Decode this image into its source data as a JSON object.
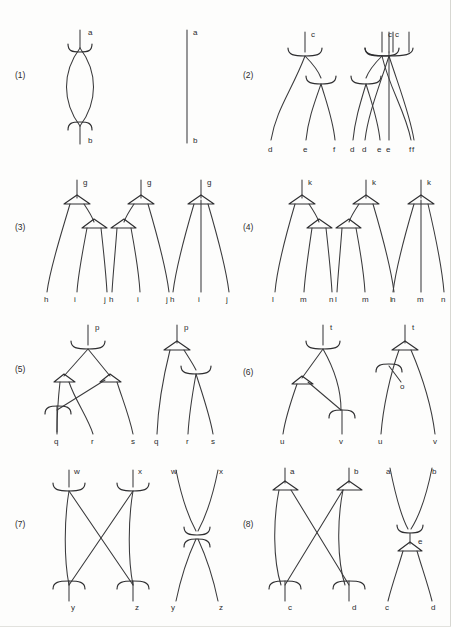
{
  "figure": {
    "background_color": "#fdfdfc",
    "stroke_color": "#3a3a3c",
    "node_types": [
      "bracket-cup-down",
      "bracket-cup-up",
      "hollow-triangle"
    ],
    "row_labels": [
      "(1)",
      "(2)",
      "(3)",
      "(4)",
      "(5)",
      "(6)",
      "(7)",
      "(8)"
    ],
    "rows": [
      {
        "number": "(1)",
        "panels": [
          {
            "id": "1a",
            "root_labels": [
              "a"
            ],
            "leaf_labels": [
              "b"
            ],
            "node_marks": [
              "bracket-cup-down",
              "bracket-cup-up"
            ],
            "shape": "lens"
          },
          {
            "id": "1b",
            "root_labels": [
              "a"
            ],
            "leaf_labels": [
              "b"
            ],
            "node_marks": [],
            "shape": "single-line"
          }
        ]
      },
      {
        "number": "(2)",
        "panels": [
          {
            "id": "2a",
            "root_labels": [
              "c"
            ],
            "leaf_labels": [
              "d",
              "e",
              "f"
            ],
            "node_marks": [
              "bracket-cup-down",
              "bracket-cup-down"
            ],
            "shape": "right-branching"
          },
          {
            "id": "2b",
            "root_labels": [
              "c"
            ],
            "leaf_labels": [
              "d",
              "e",
              "f"
            ],
            "node_marks": [
              "bracket-cup-down",
              "bracket-cup-down"
            ],
            "shape": "left-branching"
          },
          {
            "id": "2c",
            "root_labels": [
              "c"
            ],
            "leaf_labels": [
              "d",
              "e",
              "f"
            ],
            "node_marks": [
              "bracket-cup-down"
            ],
            "shape": "flat-ternary"
          }
        ]
      },
      {
        "number": "(3)",
        "panels": [
          {
            "id": "3a",
            "root_labels": [
              "g"
            ],
            "leaf_labels": [
              "h",
              "i",
              "j"
            ],
            "node_marks": [
              "hollow-triangle",
              "hollow-triangle"
            ],
            "shape": "right-branching"
          },
          {
            "id": "3b",
            "root_labels": [
              "g"
            ],
            "leaf_labels": [
              "h",
              "i",
              "j"
            ],
            "node_marks": [
              "hollow-triangle",
              "hollow-triangle"
            ],
            "shape": "left-branching"
          },
          {
            "id": "3c",
            "root_labels": [
              "g"
            ],
            "leaf_labels": [
              "h",
              "i",
              "j"
            ],
            "node_marks": [
              "hollow-triangle"
            ],
            "shape": "flat-ternary"
          }
        ]
      },
      {
        "number": "(4)",
        "panels": [
          {
            "id": "4a",
            "root_labels": [
              "k"
            ],
            "leaf_labels": [
              "l",
              "m",
              "n"
            ],
            "node_marks": [
              "hollow-triangle",
              "hollow-triangle"
            ],
            "shape": "right-branching"
          },
          {
            "id": "4b",
            "root_labels": [
              "k"
            ],
            "leaf_labels": [
              "l",
              "m",
              "n"
            ],
            "node_marks": [
              "hollow-triangle",
              "hollow-triangle"
            ],
            "shape": "left-branching"
          },
          {
            "id": "4c",
            "root_labels": [
              "k"
            ],
            "leaf_labels": [
              "l",
              "m",
              "n"
            ],
            "node_marks": [
              "hollow-triangle"
            ],
            "shape": "flat-ternary"
          }
        ]
      },
      {
        "number": "(5)",
        "panels": [
          {
            "id": "5a",
            "root_labels": [
              "p"
            ],
            "leaf_labels": [
              "q",
              "r",
              "s"
            ],
            "node_marks": [
              "bracket-cup-down",
              "hollow-triangle",
              "hollow-triangle",
              "bracket-cup-up"
            ],
            "shape": "crossing"
          },
          {
            "id": "5b",
            "root_labels": [
              "p"
            ],
            "leaf_labels": [
              "q",
              "r",
              "s"
            ],
            "node_marks": [
              "hollow-triangle",
              "bracket-cup-down"
            ],
            "shape": "right-branching"
          }
        ]
      },
      {
        "number": "(6)",
        "panels": [
          {
            "id": "6a",
            "root_labels": [
              "t"
            ],
            "leaf_labels": [
              "u",
              "v"
            ],
            "node_marks": [
              "bracket-cup-down",
              "hollow-triangle",
              "bracket-cup-up"
            ],
            "shape": "crossing"
          },
          {
            "id": "6b",
            "root_labels": [
              "t"
            ],
            "leaf_labels": [
              "u",
              "v"
            ],
            "annotation": "o",
            "node_marks": [
              "hollow-triangle",
              "bracket-cup-down"
            ],
            "shape": "annotated"
          }
        ]
      },
      {
        "number": "(7)",
        "panels": [
          {
            "id": "7a",
            "root_labels": [
              "w",
              "x"
            ],
            "leaf_labels": [
              "y",
              "z"
            ],
            "node_marks": [
              "bracket-cup-down",
              "bracket-cup-down",
              "bracket-cup-up",
              "bracket-cup-up"
            ],
            "shape": "crossed-pair"
          },
          {
            "id": "7b",
            "root_labels": [
              "w",
              "x"
            ],
            "leaf_labels": [
              "y",
              "z"
            ],
            "node_marks": [
              "bracket-cup-down",
              "bracket-cup-up"
            ],
            "shape": "hourglass"
          }
        ]
      },
      {
        "number": "(8)",
        "panels": [
          {
            "id": "8a",
            "root_labels": [
              "a",
              "b"
            ],
            "leaf_labels": [
              "c",
              "d"
            ],
            "node_marks": [
              "hollow-triangle",
              "hollow-triangle",
              "bracket-cup-up",
              "bracket-cup-up"
            ],
            "shape": "crossed-pair"
          },
          {
            "id": "8b",
            "root_labels": [
              "a",
              "b"
            ],
            "leaf_labels": [
              "c",
              "d"
            ],
            "annotation": "e",
            "node_marks": [
              "bracket-cup-down",
              "hollow-triangle"
            ],
            "shape": "hourglass"
          }
        ]
      }
    ],
    "all_leaf_labels": [
      "a",
      "b",
      "c",
      "d",
      "e",
      "f",
      "g",
      "h",
      "i",
      "j",
      "k",
      "l",
      "m",
      "n",
      "o",
      "p",
      "q",
      "r",
      "s",
      "t",
      "u",
      "v",
      "w",
      "x",
      "y",
      "z"
    ]
  }
}
